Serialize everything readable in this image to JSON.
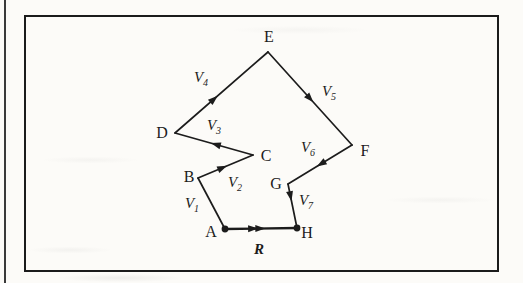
{
  "figure": {
    "ink_color": "#1c1c1c",
    "paper_color": "#fcfbf8",
    "point_font_size": 16,
    "vector_font_size": 15,
    "subscript_font_size": 10,
    "points": [
      {
        "name": "A",
        "x": 225,
        "y": 229,
        "dot": true,
        "label": {
          "text": "A",
          "x": 211,
          "y": 237
        }
      },
      {
        "name": "B",
        "x": 198,
        "y": 178,
        "dot": false,
        "label": {
          "text": "B",
          "x": 189,
          "y": 182
        }
      },
      {
        "name": "C",
        "x": 253,
        "y": 155,
        "dot": false,
        "label": {
          "text": "C",
          "x": 266,
          "y": 161
        }
      },
      {
        "name": "D",
        "x": 175,
        "y": 133,
        "dot": false,
        "label": {
          "text": "D",
          "x": 162,
          "y": 138
        }
      },
      {
        "name": "E",
        "x": 268,
        "y": 52,
        "dot": false,
        "label": {
          "text": "E",
          "x": 269,
          "y": 42
        }
      },
      {
        "name": "F",
        "x": 352,
        "y": 145,
        "dot": false,
        "label": {
          "text": "F",
          "x": 365,
          "y": 156
        }
      },
      {
        "name": "G",
        "x": 288,
        "y": 184,
        "dot": false,
        "label": {
          "text": "G",
          "x": 276,
          "y": 189
        }
      },
      {
        "name": "H",
        "x": 297,
        "y": 228,
        "dot": true,
        "label": {
          "text": "H",
          "x": 307,
          "y": 238
        }
      }
    ],
    "edges": [
      {
        "name": "V1",
        "from": "A",
        "to": "B",
        "arrows": 0,
        "t": 0.5,
        "width": 1.7,
        "label": {
          "main": "V",
          "sub": "1",
          "bold": false,
          "x": 192,
          "y": 208
        }
      },
      {
        "name": "V2",
        "from": "B",
        "to": "C",
        "arrows": 1,
        "t": 0.53,
        "width": 1.7,
        "label": {
          "main": "V",
          "sub": "2",
          "bold": false,
          "x": 235,
          "y": 187
        }
      },
      {
        "name": "V3",
        "from": "C",
        "to": "D",
        "arrows": 1,
        "t": 0.54,
        "width": 1.7,
        "label": {
          "main": "V",
          "sub": "3",
          "bold": false,
          "x": 214,
          "y": 130
        }
      },
      {
        "name": "V4",
        "from": "D",
        "to": "E",
        "arrows": 1,
        "t": 0.46,
        "width": 1.7,
        "label": {
          "main": "V",
          "sub": "4",
          "bold": false,
          "x": 201,
          "y": 82
        }
      },
      {
        "name": "V5",
        "from": "E",
        "to": "F",
        "arrows": 1,
        "t": 0.54,
        "width": 1.7,
        "label": {
          "main": "V",
          "sub": "5",
          "bold": false,
          "x": 329,
          "y": 96
        }
      },
      {
        "name": "V6",
        "from": "F",
        "to": "G",
        "arrows": 1,
        "t": 0.55,
        "width": 1.7,
        "label": {
          "main": "V",
          "sub": "6",
          "bold": false,
          "x": 308,
          "y": 152
        }
      },
      {
        "name": "V7",
        "from": "G",
        "to": "H",
        "arrows": 1,
        "t": 0.39,
        "width": 1.7,
        "label": {
          "main": "V",
          "sub": "7",
          "bold": false,
          "x": 306,
          "y": 205
        }
      },
      {
        "name": "R",
        "from": "A",
        "to": "H",
        "arrows": 2,
        "t": 0.46,
        "width": 2.3,
        "label": {
          "main": "R",
          "sub": "",
          "bold": true,
          "x": 259,
          "y": 254
        }
      }
    ]
  }
}
